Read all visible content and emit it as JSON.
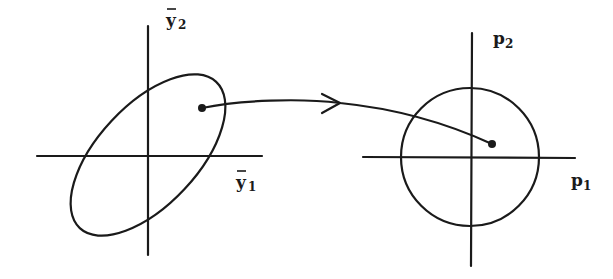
{
  "diagram": {
    "type": "mapping",
    "left_panel": {
      "axis_x_label": {
        "base": "y",
        "accent": "~",
        "sub": "1"
      },
      "axis_y_label": {
        "base": "y",
        "accent": "~",
        "sub": "2"
      },
      "shape": "tilted ellipse",
      "point": "marked point inside ellipse"
    },
    "right_panel": {
      "axis_x_label": {
        "base": "p",
        "sub": "1"
      },
      "axis_y_label": {
        "base": "p",
        "sub": "2"
      },
      "shape": "circle",
      "point": "marked point inside circle"
    },
    "connector": {
      "type": "curved arrow",
      "direction": "left-to-right"
    },
    "colors": {
      "ink": "#1a1a1a",
      "background": "#ffffff"
    }
  }
}
